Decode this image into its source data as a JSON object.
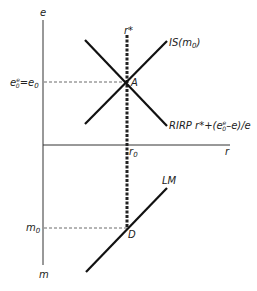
{
  "diagram": {
    "axes": {
      "vertical_top_label": "e",
      "vertical_bottom_label": "m",
      "horizontal_label": "r"
    },
    "curves": {
      "is_label": "IS(m",
      "is_sub": "0",
      "is_close": ")",
      "rirp_label": "RIRP r*+(e",
      "rirp_sup": "e",
      "rirp_sub": "0",
      "rirp_tail": "–e)/e",
      "lm_label": "LM"
    },
    "points": {
      "A": "A",
      "D": "D"
    },
    "markers": {
      "r_star": "r*",
      "r0": "r",
      "r0_sub": "0",
      "e_label_main": "e",
      "e_label_sup": "e",
      "e_label_sub": "0",
      "e_label_eq": "=e",
      "e_label_eq_sub": "0",
      "m0": "m",
      "m0_sub": "0"
    },
    "colors": {
      "line": "#111111",
      "axis": "#333333",
      "dashed": "#444444"
    }
  }
}
